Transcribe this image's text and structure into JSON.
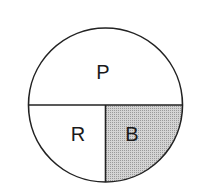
{
  "diagram": {
    "type": "partitioned-circle",
    "regions": [
      {
        "id": "top-half",
        "label": "P",
        "shaded": false,
        "fill": "#ffffff"
      },
      {
        "id": "bottom-left-quarter",
        "label": "R",
        "shaded": false,
        "fill": "#ffffff"
      },
      {
        "id": "bottom-right-quarter",
        "label": "B",
        "shaded": true,
        "fill": "#c8c8c8"
      }
    ],
    "stroke_color": "#222222"
  }
}
